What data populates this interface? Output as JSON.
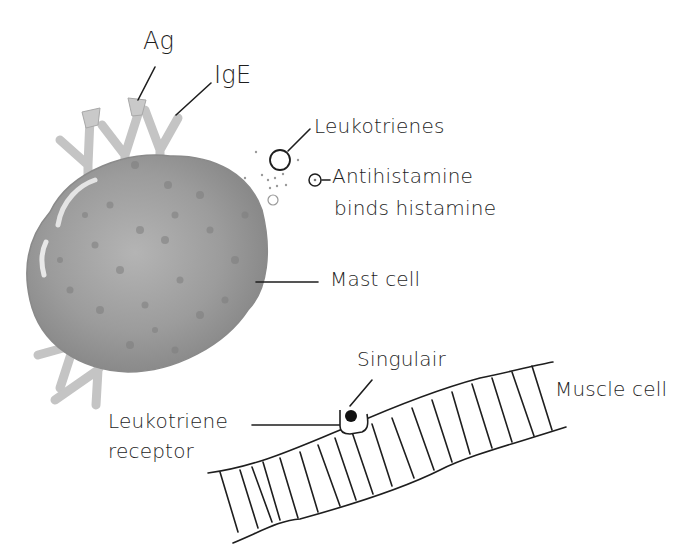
{
  "figure": {
    "type": "hand-drawn biology diagram",
    "colors": {
      "ink": "#1e1e1e",
      "cell_fill": "#9a9a9a",
      "cell_shadow": "#7c7c7c",
      "antibody": "#bdbdbd",
      "background": "#ffffff"
    }
  },
  "labels": {
    "ag": "Ag",
    "ige": "IgE",
    "leukotrienes": "Leukotrienes",
    "antihistamine_line1": "Antihistamine",
    "antihistamine_line2": "binds histamine",
    "mast_cell": "Mast cell",
    "singulair": "Singulair",
    "muscle_cell": "Muscle cell",
    "receptor_line1": "Leukotriene",
    "receptor_line2": "receptor"
  }
}
